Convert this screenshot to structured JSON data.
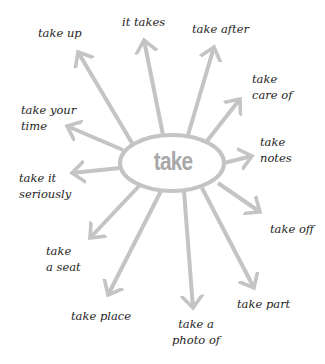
{
  "diagram": {
    "center": {
      "label": "take"
    },
    "arrow_color": "#c4c4c4",
    "center_text_color": "#a8a8a8",
    "branches": [
      {
        "id": "take-up",
        "line1": "take up",
        "line2": ""
      },
      {
        "id": "it-takes",
        "line1": "it takes",
        "line2": ""
      },
      {
        "id": "take-after",
        "line1": "take after",
        "line2": ""
      },
      {
        "id": "take-care-of",
        "line1": "take",
        "line2": "care of"
      },
      {
        "id": "take-your-time",
        "line1": "take your",
        "line2": "time"
      },
      {
        "id": "take-notes",
        "line1": "take",
        "line2": "notes"
      },
      {
        "id": "take-it-seriously",
        "line1": "take it",
        "line2": "seriously"
      },
      {
        "id": "take-off",
        "line1": "take off",
        "line2": ""
      },
      {
        "id": "take-a-seat",
        "line1": "take",
        "line2": "a seat"
      },
      {
        "id": "take-place",
        "line1": "take place",
        "line2": ""
      },
      {
        "id": "take-a-photo-of",
        "line1": "take a",
        "line2": "photo of"
      },
      {
        "id": "take-part",
        "line1": "take part",
        "line2": ""
      }
    ]
  }
}
